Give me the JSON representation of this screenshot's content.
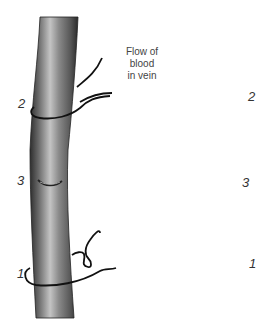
{
  "figure": {
    "flow_label": [
      "Flow of",
      "blood",
      "in vein"
    ],
    "left_vein": {
      "labels": {
        "ligature_2": "2",
        "incision_3": "3",
        "ligature_1": "1"
      }
    },
    "right_vein": {
      "labels": {
        "ligature_2": "2",
        "catheter_site_3": "3",
        "ligature_1": "1"
      }
    },
    "colors": {
      "vein_dark": "#3a3a3a",
      "vein_mid": "#7a7a7a",
      "vein_light": "#c8c8c8",
      "suture": "#111111",
      "arrow": "#9a9a9a"
    }
  }
}
